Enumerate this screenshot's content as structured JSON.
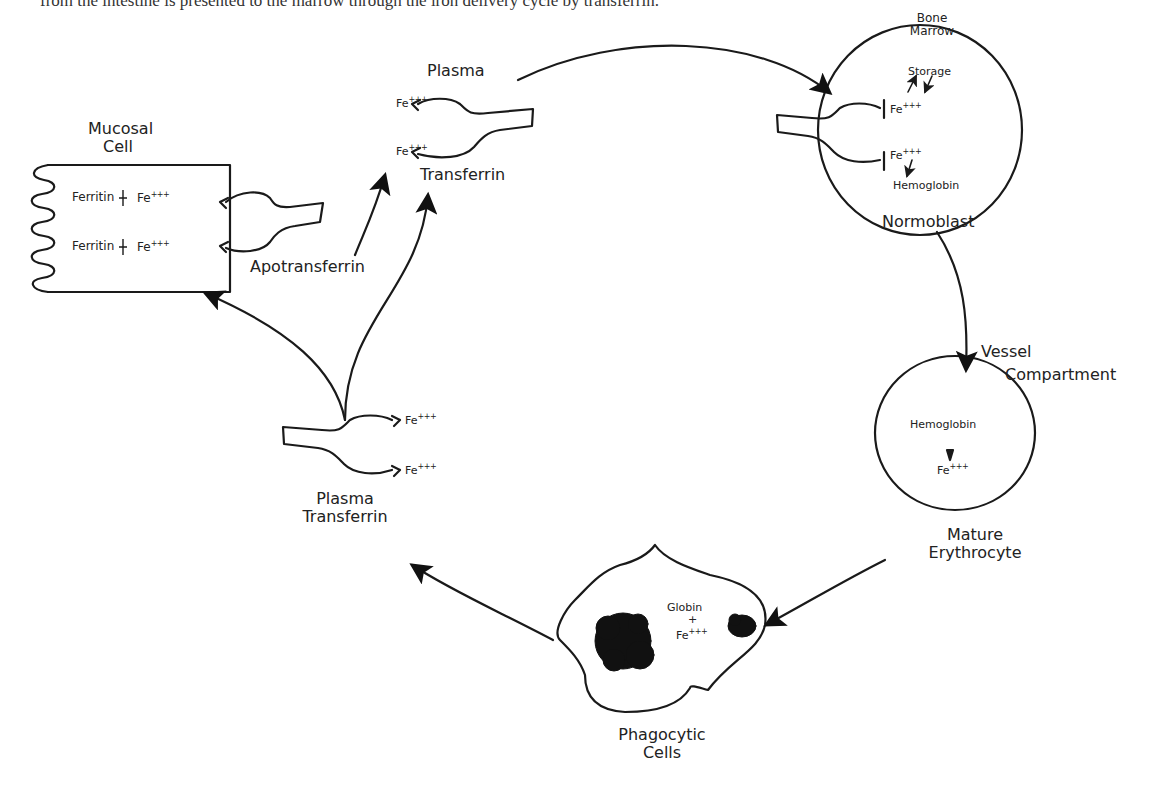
{
  "page": {
    "cut_top_text": "from the intestine is presented to the marrow through the iron delivery cycle by transferrin."
  },
  "diagram": {
    "nodes": {
      "mucosal_cell": {
        "label_line1": "Mucosal",
        "label_line2": "Cell",
        "rows": [
          {
            "left": "Ferritin",
            "right": "Fe",
            "charge": "+++"
          },
          {
            "left": "Ferritin",
            "right": "Fe",
            "charge": "+++"
          }
        ]
      },
      "apotransferrin": {
        "label": "Apotransferrin"
      },
      "plasma_transferrin_top": {
        "label_top": "Plasma",
        "label_bottom": "Transferrin",
        "sites": [
          {
            "text": "Fe",
            "charge": "+++"
          },
          {
            "text": "Fe",
            "charge": "+++"
          }
        ]
      },
      "bone_marrow": {
        "label_line1": "Bone",
        "label_line2": "Marrow",
        "storage": "Storage",
        "fe_top": "Fe",
        "fe_bottom": "Fe",
        "charge": "+++",
        "hemoglobin": "Hemoglobin",
        "cell_label": "Normoblast"
      },
      "vessel": {
        "label_line1": "Vessel",
        "label_line2": "Compartment",
        "hemoglobin": "Hemoglobin",
        "fe": "Fe",
        "charge": "+++",
        "cell_label_line1": "Mature",
        "cell_label_line2": "Erythrocyte"
      },
      "phagocytic": {
        "globin": "Globin",
        "plus": "+",
        "fe": "Fe",
        "charge": "+++",
        "label_line1": "Phagocytic",
        "label_line2": "Cells"
      },
      "plasma_transferrin_bottom": {
        "label_line1": "Plasma",
        "label_line2": "Transferrin",
        "sites": [
          {
            "text": "Fe",
            "charge": "+++"
          },
          {
            "text": "Fe",
            "charge": "+++"
          }
        ]
      }
    },
    "edges": [
      {
        "from": "Plasma Transferrin (top)",
        "to": "Bone Marrow Normoblast"
      },
      {
        "from": "Normoblast",
        "to": "Mature Erythrocyte"
      },
      {
        "from": "Mature Erythrocyte",
        "to": "Phagocytic Cells"
      },
      {
        "from": "Phagocytic Cells",
        "to": "Plasma Transferrin (bottom)"
      },
      {
        "from": "Plasma Transferrin (bottom)",
        "to": "Mucosal Cell"
      },
      {
        "from": "Plasma Transferrin (bottom)",
        "to": "Plasma Transferrin (top)"
      },
      {
        "from": "Apotransferrin",
        "to": "Plasma Transferrin (top)"
      }
    ],
    "colors": {
      "ink": "#1a1a1a",
      "background": "#ffffff"
    }
  }
}
